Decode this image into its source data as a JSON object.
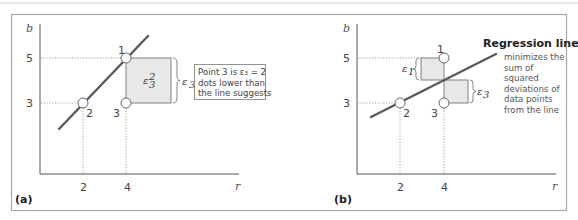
{
  "figure": {
    "panel_a": {
      "label": "(a)",
      "y_axis_label": "b",
      "x_axis_label": "r",
      "y_ticks": [
        "5",
        "3"
      ],
      "x_ticks": [
        "2",
        "4"
      ],
      "points": [
        {
          "id": "1",
          "x": 4,
          "y": 5
        },
        {
          "id": "2",
          "x": 2,
          "y": 3
        },
        {
          "id": "3",
          "x": 4,
          "y": 3
        }
      ],
      "square_label": "ε",
      "square_sub": "3",
      "square_sup": "2",
      "brace_label": "ε",
      "brace_sub": "3",
      "note_lines": [
        "Point 3 is ε₃ = 2",
        "dots lower than",
        "the line suggests"
      ]
    },
    "panel_b": {
      "label": "(b)",
      "y_axis_label": "b",
      "x_axis_label": "r",
      "y_ticks": [
        "5",
        "3"
      ],
      "x_ticks": [
        "2",
        "4"
      ],
      "points": [
        {
          "id": "1",
          "x": 4,
          "y": 5
        },
        {
          "id": "2",
          "x": 2,
          "y": 3
        },
        {
          "id": "3",
          "x": 4,
          "y": 3
        }
      ],
      "eps1_label": "ε",
      "eps1_sub": "1",
      "eps3_label": "ε",
      "eps3_sub": "3",
      "title": "Regression line",
      "body_lines": [
        "minimizes the",
        "sum of",
        "squared",
        "deviations of",
        "data points",
        "from the line"
      ]
    }
  },
  "colors": {
    "line": "#5a5a5a",
    "frame": "#a8a8a8",
    "square_fill": "#e8e8e8",
    "axis": "#555555"
  }
}
